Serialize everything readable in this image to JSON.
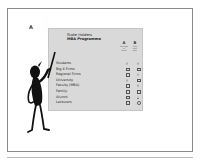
{
  "figure_label": "A",
  "slide": {
    "title_line1": "Stake Holders",
    "title_line2": "MBA Programme",
    "columns": [
      {
        "letter": "A",
        "sub": [
          "Strength",
          "of",
          "Power"
        ]
      },
      {
        "letter": "B",
        "sub": [
          "Only",
          "have",
          "time"
        ]
      }
    ],
    "rows": [
      {
        "label": "Students",
        "a": "triangle",
        "b": "triangle"
      },
      {
        "label": "Big 4 Firms",
        "a": "square",
        "b": "square"
      },
      {
        "label": "Regional Firms",
        "a": "square",
        "b": "triangle"
      },
      {
        "label": "University",
        "a": "triangle",
        "b": "square"
      },
      {
        "label": "Faculty (MBA)",
        "a": "square",
        "b": "triangle"
      },
      {
        "label": "Family",
        "a": "square",
        "b": "square"
      },
      {
        "label": "Alumni",
        "a": "square",
        "b": "triangle"
      },
      {
        "label": "Lecturers",
        "a": "square",
        "b": "circle"
      }
    ]
  },
  "illustration": "stick-figure-pointing"
}
